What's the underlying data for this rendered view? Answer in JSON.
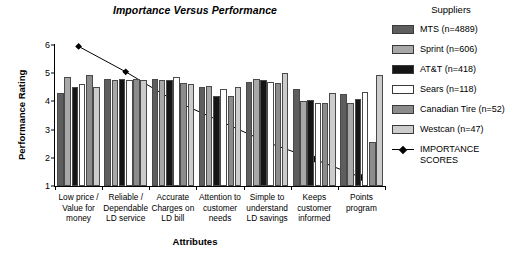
{
  "chart_data": {
    "type": "bar",
    "title": "Importance Versus Performance",
    "xlabel": "Attributes",
    "ylabel": "Performance Rating",
    "ylim": [
      1,
      6
    ],
    "yticks": [
      1,
      2,
      3,
      4,
      5,
      6
    ],
    "grid": false,
    "legend_position": "right",
    "legend_title": "Suppliers",
    "categories": [
      "Low price / Value for money",
      "Reliable / Dependable LD service",
      "Accurate Charges on LD bill",
      "Attention to customer needs",
      "Simple to understand LD savings",
      "Keeps customer informed",
      "Points program"
    ],
    "category_lines": [
      [
        "Low price /",
        "Value for",
        "money"
      ],
      [
        "Reliable /",
        "Dependable",
        "LD service"
      ],
      [
        "Accurate",
        "Charges on",
        "LD bill"
      ],
      [
        "Attention to",
        "customer",
        "needs"
      ],
      [
        "Simple to",
        "understand",
        "LD savings"
      ],
      [
        "Keeps",
        "customer",
        "informed"
      ],
      [
        "Points",
        "program"
      ]
    ],
    "series": [
      {
        "name": "MTS (n=4889)",
        "short": "MTS",
        "n": 4889,
        "color": "#5e5e5e",
        "values": [
          4.3,
          4.8,
          4.8,
          4.5,
          4.7,
          4.45,
          4.25
        ]
      },
      {
        "name": "Sprint (n=606)",
        "short": "Sprint",
        "n": 606,
        "color": "#a8a8a8",
        "values": [
          4.85,
          4.75,
          4.75,
          4.55,
          4.8,
          4.0,
          3.95
        ]
      },
      {
        "name": "AT&T (n=418)",
        "short": "AT&T",
        "n": 418,
        "color": "#151515",
        "values": [
          4.5,
          4.8,
          4.75,
          4.2,
          4.75,
          4.05,
          4.1
        ]
      },
      {
        "name": "Sears (n=118)",
        "short": "Sears",
        "n": 118,
        "color": "#ffffff",
        "values": [
          4.6,
          4.75,
          4.85,
          4.45,
          4.7,
          3.95,
          4.35
        ]
      },
      {
        "name": "Canadian Tire (n=52)",
        "short": "Canadian Tire",
        "n": 52,
        "color": "#8c8c8c",
        "values": [
          4.95,
          4.8,
          4.65,
          4.2,
          4.65,
          3.95,
          2.55
        ]
      },
      {
        "name": "Westcan (n=47)",
        "short": "Westcan",
        "n": 47,
        "color": "#cccccc",
        "values": [
          4.5,
          4.75,
          4.6,
          4.5,
          5.0,
          4.3,
          4.95
        ]
      }
    ],
    "importance_line": {
      "name": "IMPORTANCE SCORES",
      "legend_label_lines": [
        "IMPORTANCE",
        "SCORES"
      ],
      "color": "#000000",
      "marker": "diamond",
      "values": [
        5.95,
        5.05,
        4.05,
        3.3,
        2.55,
        1.95,
        1.3
      ]
    }
  }
}
